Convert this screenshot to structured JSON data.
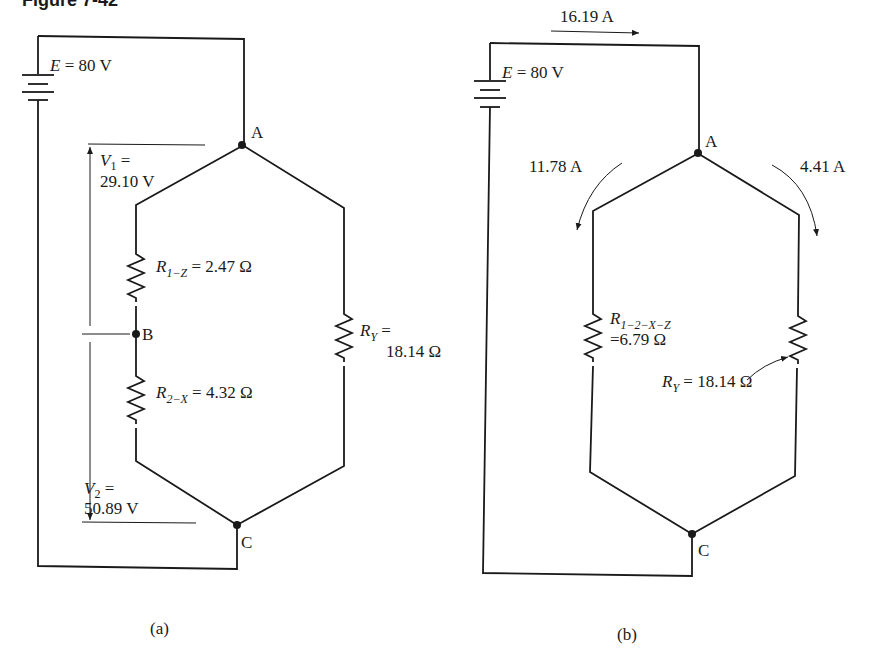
{
  "figure": {
    "title_partial": "Figure 7-42"
  },
  "panel_a": {
    "caption": "(a)",
    "source": {
      "symbol": "E",
      "eq": " = 80 V"
    },
    "nodes": {
      "A": "A",
      "B": "B",
      "C": "C"
    },
    "v1": {
      "symbol": "V",
      "sub": "1",
      "eq": " =",
      "value": "29.10 V"
    },
    "v2": {
      "symbol": "V",
      "sub": "2",
      "eq": " =",
      "value": "50.89 V"
    },
    "r1z": {
      "symbol": "R",
      "sub": "1−Z",
      "value": " = 2.47 Ω"
    },
    "r2x": {
      "symbol": "R",
      "sub": "2−X",
      "value": " = 4.32 Ω"
    },
    "ry": {
      "symbol": "R",
      "sub": "Y",
      "eq": " =",
      "value": "18.14 Ω"
    }
  },
  "panel_b": {
    "caption": "(b)",
    "source": {
      "symbol": "E",
      "eq": " = 80 V"
    },
    "nodes": {
      "A": "A",
      "C": "C"
    },
    "total_current": "16.19 A",
    "left_current": "11.78 A",
    "right_current": "4.41 A",
    "r12xz": {
      "symbol": "R",
      "sub": "1−2−X−Z",
      "value": "=6.79 Ω"
    },
    "ry": {
      "symbol": "R",
      "sub": "Y",
      "value": " = 18.14 Ω"
    }
  }
}
